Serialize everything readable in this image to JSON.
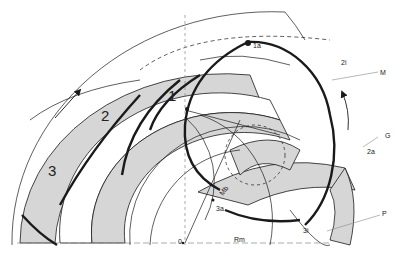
{
  "diagram": {
    "type": "technical drawing",
    "colors": {
      "line": "#1a1a1a",
      "fill": "#d6d6d6",
      "background": "#ffffff"
    },
    "band_labels": [
      "1",
      "2",
      "3"
    ],
    "point_labels": {
      "p1a": "1a",
      "p2i": "2i",
      "p2a": "2a",
      "p3i": "3i",
      "p3a": "3a",
      "origin": "0",
      "mb": "Mb",
      "rm": "Rm"
    },
    "callout_labels": {
      "M": "M",
      "G": "G",
      "P": "P"
    }
  }
}
